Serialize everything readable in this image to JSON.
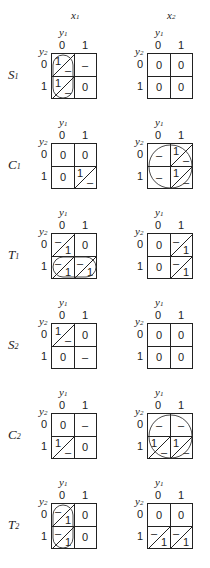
{
  "header": {
    "x1": "x1",
    "x2": "x2",
    "y1": "y1",
    "y2": "y2",
    "zero": "0",
    "one": "1"
  },
  "rows": [
    {
      "label": "S1",
      "left": {
        "cells": [
          [
            "1/–",
            "–"
          ],
          [
            "1/–",
            "0"
          ]
        ],
        "loop": "col0"
      },
      "right": {
        "cells": [
          [
            "0",
            "0"
          ],
          [
            "0",
            "0"
          ]
        ],
        "loop": "none"
      }
    },
    {
      "label": "C1",
      "left": {
        "cells": [
          [
            "0",
            "0"
          ],
          [
            "0",
            "1/–"
          ]
        ],
        "loop": "none"
      },
      "right": {
        "cells": [
          [
            "–",
            "1/–"
          ],
          [
            "–",
            "1/–"
          ]
        ],
        "loop": "all"
      }
    },
    {
      "label": "T1",
      "left": {
        "cells": [
          [
            "–/1",
            "0"
          ],
          [
            "–/1",
            "–/1"
          ]
        ],
        "loop": "row1"
      },
      "right": {
        "cells": [
          [
            "0",
            "–/1"
          ],
          [
            "0",
            "–/1"
          ]
        ],
        "loop": "none"
      }
    },
    {
      "label": "S2",
      "left": {
        "cells": [
          [
            "1/–",
            "0"
          ],
          [
            "0",
            "–"
          ]
        ],
        "loop": "none"
      },
      "right": {
        "cells": [
          [
            "0",
            "0"
          ],
          [
            "0",
            "0"
          ]
        ],
        "loop": "none"
      }
    },
    {
      "label": "C2",
      "left": {
        "cells": [
          [
            "0",
            "–"
          ],
          [
            "1/–",
            "0"
          ]
        ],
        "loop": "none"
      },
      "right": {
        "cells": [
          [
            "–",
            "–"
          ],
          [
            "1/–",
            "1/–"
          ]
        ],
        "loop": "all"
      }
    },
    {
      "label": "T2",
      "left": {
        "cells": [
          [
            "–/1",
            "0"
          ],
          [
            "–/1",
            "0"
          ]
        ],
        "loop": "col0"
      },
      "right": {
        "cells": [
          [
            "0",
            "0"
          ],
          [
            "–/1",
            "–/1"
          ]
        ],
        "loop": "none"
      }
    }
  ],
  "caption": ""
}
